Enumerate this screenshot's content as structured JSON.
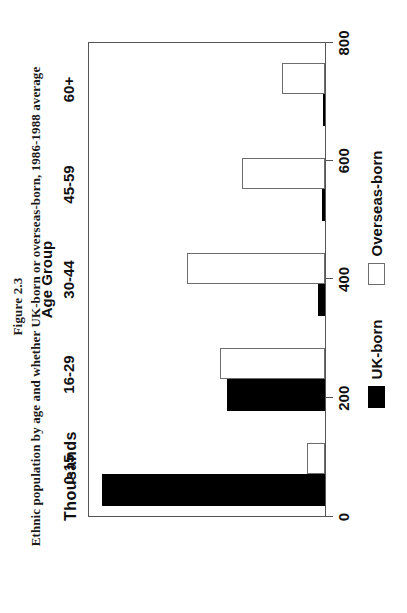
{
  "figure": {
    "number": "Figure 2.3",
    "caption": "Ethnic population by age and whether UK-born or overseas-born, 1986-1988 average"
  },
  "axes": {
    "value_unit_label": "Thousands",
    "category_axis_title": "Age Group"
  },
  "legend": {
    "items": [
      {
        "label": "UK-born",
        "color": "#000000",
        "style": "filled"
      },
      {
        "label": "Overseas-born",
        "color": "#ffffff",
        "style": "outline"
      }
    ]
  },
  "chart_data": {
    "type": "bar",
    "title": "Ethnic population by age and whether UK-born or overseas-born, 1986-1988 average",
    "subtitle": "Figure 2.3",
    "orientation": "vertical",
    "xlabel": "Age Group",
    "ylabel": "Thousands",
    "ylim": [
      0,
      800
    ],
    "yticks": [
      0,
      200,
      400,
      600,
      800
    ],
    "ytick_labels": [
      "0",
      "200",
      "400",
      "600",
      "800"
    ],
    "grid": false,
    "legend_position": "bottom",
    "categories": [
      "0-15",
      "16-29",
      "30-44",
      "45-59",
      "60+"
    ],
    "series": [
      {
        "name": "UK-born",
        "color": "#000000",
        "values": [
          750,
          330,
          25,
          10,
          8
        ]
      },
      {
        "name": "Overseas-born",
        "color": "#ffffff",
        "values": [
          60,
          353,
          465,
          280,
          145
        ]
      }
    ]
  }
}
